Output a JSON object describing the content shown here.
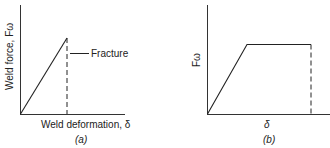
{
  "panels": [
    {
      "id": "a",
      "caption": "(a)",
      "ylabel": "Weld force, Fω",
      "xlabel": "Weld deformation, δ",
      "annotation": "Fracture",
      "curve": "linear rise to fracture, then dashed drop to zero",
      "line_color": "#222222"
    },
    {
      "id": "b",
      "caption": "(b)",
      "ylabel": "Fω",
      "xlabel": "δ",
      "curve": "linear rise, horizontal plateau, dashed drop to zero",
      "line_color": "#222222"
    }
  ]
}
